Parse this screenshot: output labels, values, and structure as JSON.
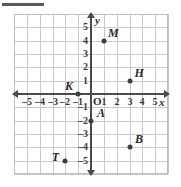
{
  "figure": {
    "name": "coordinate-plane-graph",
    "corner_rule": true
  },
  "chart_data": {
    "type": "scatter",
    "title": "",
    "xlabel": "x",
    "ylabel": "y",
    "xlim": [
      -6,
      6
    ],
    "ylim": [
      -6,
      6
    ],
    "grid": true,
    "legend": null,
    "origin_label": "O",
    "x_ticks": [
      {
        "value": -5,
        "label": "–5"
      },
      {
        "value": -4,
        "label": "–4"
      },
      {
        "value": -3,
        "label": "–3"
      },
      {
        "value": -2,
        "label": "–2"
      },
      {
        "value": -1,
        "label": "–1"
      },
      {
        "value": 1,
        "label": "1"
      },
      {
        "value": 2,
        "label": "2"
      },
      {
        "value": 3,
        "label": "3"
      },
      {
        "value": 4,
        "label": "4"
      },
      {
        "value": 5,
        "label": "5"
      }
    ],
    "y_ticks": [
      {
        "value": 5,
        "label": "5"
      },
      {
        "value": 4,
        "label": "4"
      },
      {
        "value": 3,
        "label": "3"
      },
      {
        "value": 2,
        "label": "2"
      },
      {
        "value": 1,
        "label": "1"
      },
      {
        "value": -1,
        "label": "–1"
      },
      {
        "value": -2,
        "label": "–2"
      },
      {
        "value": -3,
        "label": "–3"
      },
      {
        "value": -4,
        "label": "–4"
      },
      {
        "value": -5,
        "label": "–5"
      }
    ],
    "points": [
      {
        "label": "M",
        "x": 1,
        "y": 4,
        "label_dx": 0.75,
        "label_dy": 0.55
      },
      {
        "label": "H",
        "x": 3,
        "y": 1,
        "label_dx": 0.75,
        "label_dy": 0.55
      },
      {
        "label": "K",
        "x": -1,
        "y": 0,
        "label_dx": -0.72,
        "label_dy": 0.6
      },
      {
        "label": "A",
        "x": 0,
        "y": -2,
        "label_dx": 0.78,
        "label_dy": 0.55
      },
      {
        "label": "B",
        "x": 3,
        "y": -4,
        "label_dx": 0.75,
        "label_dy": 0.6
      },
      {
        "label": "T",
        "x": -2,
        "y": -5,
        "label_dx": -0.78,
        "label_dy": 0.3
      }
    ]
  },
  "colors": {
    "grid": "#c9c9c9",
    "axis": "#4a4a4a",
    "point": "#3c3c3c",
    "text": "#2b2b2b",
    "background": "#ffffff"
  }
}
